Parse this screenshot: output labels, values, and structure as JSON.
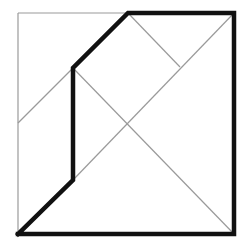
{
  "diagram": {
    "type": "geometric-dissection",
    "colors": {
      "background": "#ffffff",
      "thin_line": "#9a9a9a",
      "thick_line": "#111111"
    },
    "square": {
      "x1": 18,
      "y1": 13,
      "x2": 234,
      "y2": 234
    },
    "thick_outline_points": [
      [
        18,
        234
      ],
      [
        73,
        180
      ],
      [
        73,
        68
      ],
      [
        128,
        13
      ],
      [
        234,
        13
      ],
      [
        234,
        234
      ],
      [
        18,
        234
      ]
    ],
    "thin_lines": [
      {
        "name": "square-top-left-edge",
        "from": [
          18,
          13
        ],
        "to": [
          128,
          13
        ]
      },
      {
        "name": "square-left-edge",
        "from": [
          18,
          13
        ],
        "to": [
          18,
          234
        ]
      },
      {
        "name": "diagonal-main",
        "from": [
          73,
          68
        ],
        "to": [
          234,
          234
        ]
      },
      {
        "name": "diagonal-anti",
        "from": [
          73,
          180
        ],
        "to": [
          234,
          13
        ]
      },
      {
        "name": "left-edge-connector",
        "from": [
          18,
          123
        ],
        "to": [
          73,
          68
        ]
      },
      {
        "name": "top-connector",
        "from": [
          128,
          13
        ],
        "to": [
          180,
          67
        ]
      }
    ]
  }
}
